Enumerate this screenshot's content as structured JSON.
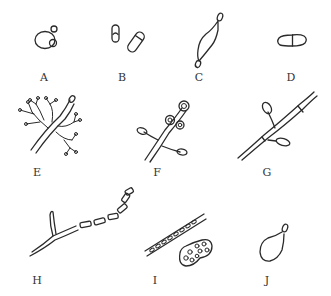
{
  "figure": {
    "type": "scientific-illustration",
    "stroke_color": "#2a2a2a",
    "background": "#ffffff"
  },
  "panels": [
    {
      "label": "A",
      "x": 44,
      "y": 77
    },
    {
      "label": "B",
      "x": 122,
      "y": 77
    },
    {
      "label": "C",
      "x": 199,
      "y": 77
    },
    {
      "label": "D",
      "x": 291,
      "y": 77
    },
    {
      "label": "E",
      "x": 37,
      "y": 172
    },
    {
      "label": "F",
      "x": 157,
      "y": 172
    },
    {
      "label": "G",
      "x": 267,
      "y": 172
    },
    {
      "label": "H",
      "x": 37,
      "y": 280
    },
    {
      "label": "I",
      "x": 155,
      "y": 280
    },
    {
      "label": "J",
      "x": 267,
      "y": 280
    }
  ]
}
